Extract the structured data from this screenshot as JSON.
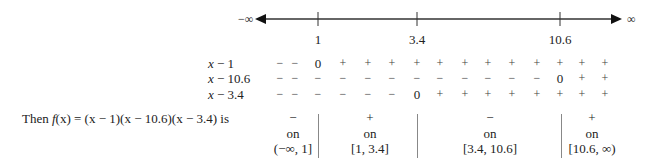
{
  "number_line": {
    "left_label": "−∞",
    "right_label": "∞",
    "ticks": [
      {
        "label": "1",
        "x": 318
      },
      {
        "label": "3.4",
        "x": 417
      },
      {
        "label": "10.6",
        "x": 560
      }
    ]
  },
  "sign_chart": {
    "column_x": [
      280,
      295,
      318,
      343,
      368,
      392,
      417,
      440,
      465,
      488,
      512,
      537,
      560,
      582,
      605
    ],
    "rows": [
      {
        "factor_var": "x",
        "factor_rest": " − 1",
        "signs": [
          "−",
          "−",
          "0",
          "+",
          "+",
          "+",
          "+",
          "+",
          "+",
          "+",
          "+",
          "+",
          "+",
          "+",
          "+"
        ]
      },
      {
        "factor_var": "x",
        "factor_rest": " − 10.6",
        "signs": [
          "−",
          "−",
          "−",
          "−",
          "−",
          "−",
          "−",
          "−",
          "−",
          "−",
          "−",
          "−",
          "0",
          "+",
          "+"
        ]
      },
      {
        "factor_var": "x",
        "factor_rest": " − 3.4",
        "signs": [
          "−",
          "−",
          "−",
          "−",
          "−",
          "−",
          "0",
          "+",
          "+",
          "+",
          "+",
          "+",
          "+",
          "+",
          "+"
        ]
      }
    ]
  },
  "summary": {
    "lead_then": "Then ",
    "lead_f": "f",
    "lead_rest": "(x) = (x − 1)(x − 10.6)(x − 3.4) is",
    "intervals": [
      {
        "sign": "−",
        "on": "on",
        "interval": "(−∞, 1]",
        "x": 293
      },
      {
        "sign": "+",
        "on": "on",
        "interval": "[1, 3.4]",
        "x": 370
      },
      {
        "sign": "−",
        "on": "on",
        "interval": "[3.4, 10.6]",
        "x": 490
      },
      {
        "sign": "+",
        "on": "on",
        "interval": "[10.6, ∞)",
        "x": 592
      }
    ],
    "dividers_x": [
      318,
      417,
      561
    ]
  }
}
